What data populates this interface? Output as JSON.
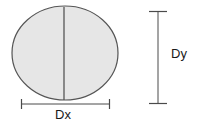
{
  "figure": {
    "background_color": "#ffffff",
    "shape": {
      "name": "ellipse",
      "fill_color": "#e6e6e6",
      "stroke_color": "#555555",
      "stroke_width": 1.2,
      "center_x": 65,
      "center_y": 53,
      "radius_x": 53,
      "radius_y": 47
    },
    "center_line": {
      "name": "vertical-center-line",
      "stroke_color": "#4a4a4a",
      "stroke_width": 1.2,
      "x": 64,
      "y_top": 7,
      "y_bottom": 100
    },
    "dimensions": [
      {
        "id": "dx",
        "label": "Dx",
        "orientation": "horizontal",
        "stroke_color": "#4a4a4a",
        "stroke_width": 1,
        "line_start_x": 21,
        "line_end_x": 110,
        "line_y": 104,
        "tick_half_length": 5
      },
      {
        "id": "dy",
        "label": "Dy",
        "orientation": "vertical",
        "stroke_color": "#4a4a4a",
        "stroke_width": 1,
        "line_x": 158,
        "line_start_y": 11,
        "line_end_y": 104,
        "tick_half_length": 9
      }
    ]
  }
}
